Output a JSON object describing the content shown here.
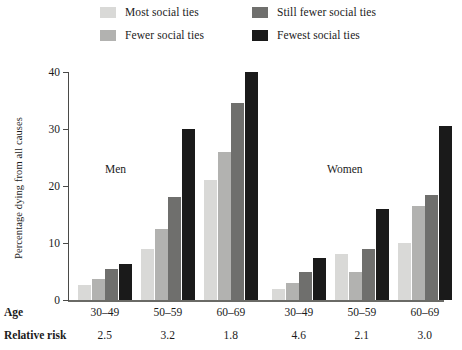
{
  "legend": {
    "items": [
      {
        "label": "Most social ties",
        "color": "#d9d9d7"
      },
      {
        "label": "Fewer social ties",
        "color": "#b2b2b0"
      },
      {
        "label": "Still fewer social ties",
        "color": "#6f6f6d"
      },
      {
        "label": "Fewest social ties",
        "color": "#1a1a1a"
      }
    ]
  },
  "axis": {
    "ylabel": "Percentage dying from all causes",
    "yticks": [
      "0",
      "10",
      "20",
      "30",
      "40"
    ]
  },
  "panels": [
    {
      "label": "Men"
    },
    {
      "label": "Women"
    }
  ],
  "rows": {
    "age_header": "Age",
    "risk_header": "Relative risk"
  },
  "chart_data": {
    "type": "bar",
    "title": "",
    "xlabel": "Age",
    "ylabel": "Percentage dying from all causes",
    "ylim": [
      0,
      40
    ],
    "yticks": [
      0,
      10,
      20,
      30,
      40
    ],
    "grid": false,
    "legend_position": "top",
    "categories": [
      "30–49",
      "50–59",
      "60–69",
      "30–49",
      "50–59",
      "60–69"
    ],
    "panel_of_category": [
      "Men",
      "Men",
      "Men",
      "Women",
      "Women",
      "Women"
    ],
    "relative_risk": [
      2.5,
      3.2,
      1.8,
      4.6,
      2.1,
      3.0
    ],
    "series": [
      {
        "name": "Most social ties",
        "color": "#d9d9d7",
        "values": [
          2.6,
          9.0,
          21.0,
          2.0,
          8.0,
          10.0
        ]
      },
      {
        "name": "Fewer social ties",
        "color": "#b2b2b0",
        "values": [
          3.6,
          12.5,
          26.0,
          3.0,
          5.0,
          16.5
        ]
      },
      {
        "name": "Still fewer social ties",
        "color": "#6f6f6d",
        "values": [
          5.5,
          18.0,
          34.5,
          5.0,
          9.0,
          18.5
        ]
      },
      {
        "name": "Fewest social ties",
        "color": "#1a1a1a",
        "values": [
          6.4,
          30.0,
          40.0,
          7.3,
          16.0,
          30.5
        ]
      }
    ]
  }
}
